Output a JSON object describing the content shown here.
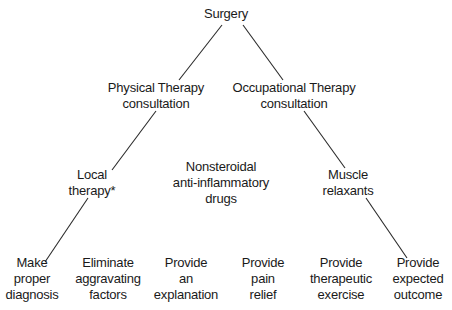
{
  "diagram": {
    "type": "tree",
    "nodes": {
      "surgery": {
        "lines": [
          "Surgery"
        ]
      },
      "pt": {
        "lines": [
          "Physical Therapy",
          "consultation"
        ]
      },
      "ot": {
        "lines": [
          "Occupational Therapy",
          "consultation"
        ]
      },
      "local": {
        "lines": [
          "Local",
          "therapy*"
        ]
      },
      "nsaid": {
        "lines": [
          "Nonsteroidal",
          "anti-inflammatory",
          "drugs"
        ]
      },
      "muscle": {
        "lines": [
          "Muscle",
          "relaxants"
        ]
      },
      "diagnosis": {
        "lines": [
          "Make",
          "proper",
          "diagnosis"
        ]
      },
      "eliminate": {
        "lines": [
          "Eliminate",
          "aggravating",
          "factors"
        ]
      },
      "explanation": {
        "lines": [
          "Provide",
          "an",
          "explanation"
        ]
      },
      "pain": {
        "lines": [
          "Provide",
          "pain",
          "relief"
        ]
      },
      "exercise": {
        "lines": [
          "Provide",
          "therapeutic",
          "exercise"
        ]
      },
      "outcome": {
        "lines": [
          "Provide",
          "expected",
          "outcome"
        ]
      }
    },
    "edges": [
      {
        "from": "surgery",
        "to": "pt",
        "x1": 222,
        "y1": 25,
        "x2": 179,
        "y2": 80
      },
      {
        "from": "surgery",
        "to": "ot",
        "x1": 243,
        "y1": 25,
        "x2": 283,
        "y2": 80
      },
      {
        "from": "pt",
        "to": "local",
        "x1": 156,
        "y1": 111,
        "x2": 112,
        "y2": 170
      },
      {
        "from": "local",
        "to": "diagnosis",
        "x1": 88,
        "y1": 198,
        "x2": 45,
        "y2": 262
      },
      {
        "from": "ot",
        "to": "muscle",
        "x1": 304,
        "y1": 111,
        "x2": 345,
        "y2": 168
      },
      {
        "from": "muscle",
        "to": "outcome",
        "x1": 366,
        "y1": 198,
        "x2": 407,
        "y2": 258
      }
    ],
    "line_color": "#2a2a2a",
    "text_color": "#1a1a1a",
    "background": "#ffffff"
  }
}
